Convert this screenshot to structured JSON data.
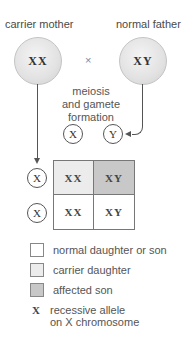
{
  "parents": {
    "mother": {
      "label": "carrier mother",
      "genotype": "XX"
    },
    "father": {
      "label": "normal father",
      "genotype": "XY"
    },
    "cross_symbol": "×"
  },
  "process_label": [
    "meiosis",
    "and gamete",
    "formation"
  ],
  "gametes": {
    "father": [
      "X",
      "Y"
    ],
    "mother": [
      "X",
      "X"
    ]
  },
  "punnett": {
    "cells": [
      [
        {
          "genotype": "XX",
          "type": "carrier daughter"
        },
        {
          "genotype": "XY",
          "type": "affected son"
        }
      ],
      [
        {
          "genotype": "XX",
          "type": "normal daughter"
        },
        {
          "genotype": "XY",
          "type": "normal son"
        }
      ]
    ]
  },
  "legend": {
    "items": [
      {
        "label": "normal daughter or son",
        "color": "#ffffff"
      },
      {
        "label": "carrier daughter",
        "color": "#ececec"
      },
      {
        "label": "affected son",
        "color": "#c8c8c8"
      }
    ],
    "allele_symbol": "X",
    "allele_label_line1": "recessive allele",
    "allele_label_line2": "on X chromosome"
  },
  "colors": {
    "normal": "#ffffff",
    "carrier": "#ececec",
    "affected": "#c8c8c8"
  }
}
